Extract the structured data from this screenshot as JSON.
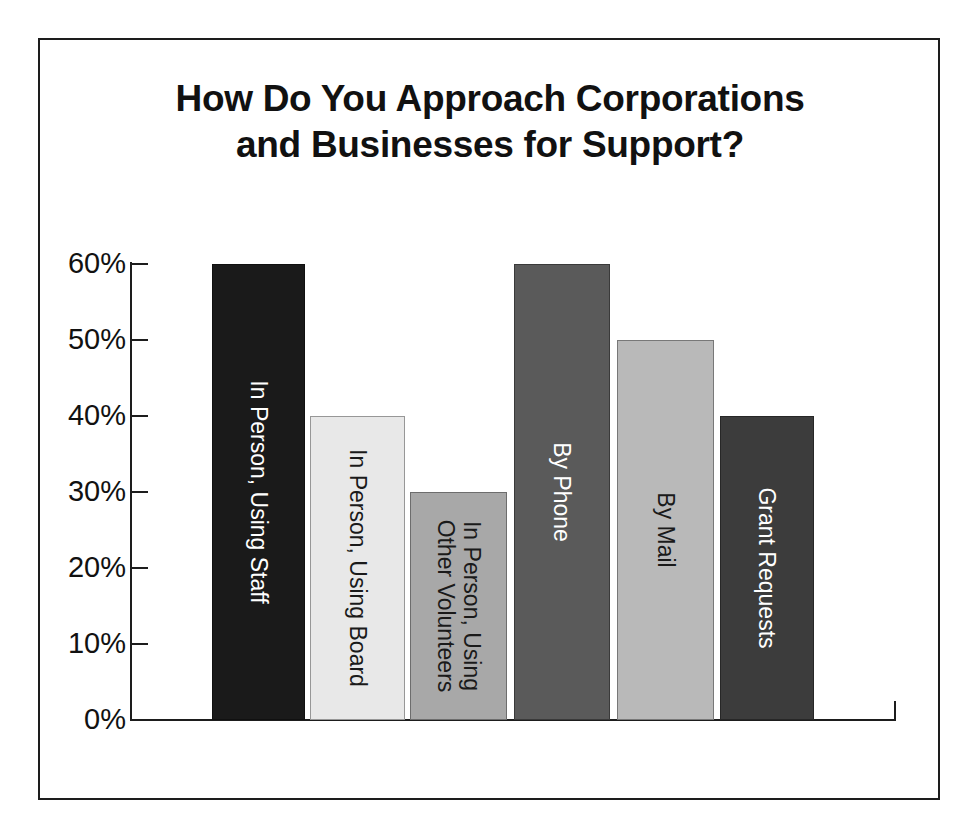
{
  "chart_data": {
    "type": "bar",
    "title": "How Do You Approach Corporations and Businesses for Support?",
    "title_lines": [
      "How Do You Approach Corporations",
      "and Businesses for Support?"
    ],
    "xlabel": "",
    "ylabel": "",
    "ylim": [
      0,
      60
    ],
    "grid": false,
    "legend": "none",
    "ytick_labels": [
      "0%",
      "10%",
      "20%",
      "30%",
      "40%",
      "50%",
      "60%"
    ],
    "ytick_values": [
      0,
      10,
      20,
      30,
      40,
      50,
      60
    ],
    "categories": [
      "In Person, Using Staff",
      "In Person, Using Board",
      "In Person, Using\nOther Volunteers",
      "By Phone",
      "By Mail",
      "Grant Requests"
    ],
    "values": [
      60,
      40,
      30,
      60,
      50,
      40
    ],
    "bars": [
      {
        "label": "In Person, Using Staff",
        "value": 60,
        "value_label": "60%",
        "fill": "#1a1a1a",
        "text_color": "#ffffff"
      },
      {
        "label": "In Person, Using Board",
        "value": 40,
        "value_label": "40%",
        "fill": "#e8e8e8",
        "text_color": "#1a1a1a"
      },
      {
        "label": "In Person, Using\nOther Volunteers",
        "value": 30,
        "value_label": "30%",
        "fill": "#a8a8a8",
        "text_color": "#1a1a1a"
      },
      {
        "label": "By Phone",
        "value": 60,
        "value_label": "60%",
        "fill": "#5a5a5a",
        "text_color": "#ffffff"
      },
      {
        "label": "By Mail",
        "value": 50,
        "value_label": "50%",
        "fill": "#b9b9b9",
        "text_color": "#1a1a1a"
      },
      {
        "label": "Grant Requests",
        "value": 40,
        "value_label": "40%",
        "fill": "#3c3c3c",
        "text_color": "#ffffff"
      }
    ],
    "colors": {
      "axis": "#1d1d1d",
      "frame": "#1d1d1d",
      "background": "#ffffff",
      "title": "#111111"
    }
  }
}
